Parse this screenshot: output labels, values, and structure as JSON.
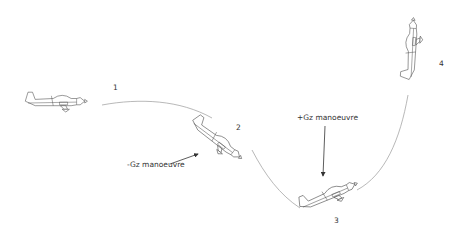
{
  "diagram": {
    "type": "manoeuvre-sequence",
    "positions": [
      {
        "id": 1,
        "label": "1",
        "attitude": "level"
      },
      {
        "id": 2,
        "label": "2",
        "attitude": "nose-down dive"
      },
      {
        "id": 3,
        "label": "3",
        "attitude": "pull-up climbing"
      },
      {
        "id": 4,
        "label": "4",
        "attitude": "vertical nose-up"
      }
    ],
    "annotations": [
      {
        "label": "-Gz manoeuvre",
        "points_to": "position 2"
      },
      {
        "label": "+Gz manoeuvre",
        "points_to": "position 3"
      }
    ]
  }
}
